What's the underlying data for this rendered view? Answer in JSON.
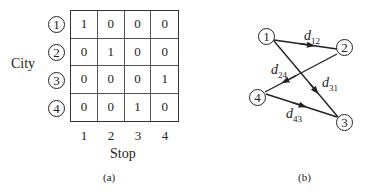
{
  "panel_a": {
    "caption": "(a)",
    "row_axis_label": "City",
    "col_axis_label": "Stop",
    "row_labels": [
      "1",
      "2",
      "3",
      "4"
    ],
    "col_labels": [
      "1",
      "2",
      "3",
      "4"
    ],
    "matrix": [
      [
        "1",
        "0",
        "0",
        "0"
      ],
      [
        "0",
        "1",
        "0",
        "0"
      ],
      [
        "0",
        "0",
        "0",
        "1"
      ],
      [
        "0",
        "0",
        "1",
        "0"
      ]
    ]
  },
  "panel_b": {
    "caption": "(b)",
    "nodes": [
      {
        "id": "1",
        "label": "1"
      },
      {
        "id": "2",
        "label": "2"
      },
      {
        "id": "3",
        "label": "3"
      },
      {
        "id": "4",
        "label": "4"
      }
    ],
    "edges": [
      {
        "from": "1",
        "to": "2",
        "label_main": "d",
        "label_sub": "12"
      },
      {
        "from": "2",
        "to": "4",
        "label_main": "d",
        "label_sub": "24"
      },
      {
        "from": "3",
        "to": "1",
        "label_main": "d",
        "label_sub": "31"
      },
      {
        "from": "4",
        "to": "3",
        "label_main": "d",
        "label_sub": "43"
      }
    ]
  }
}
